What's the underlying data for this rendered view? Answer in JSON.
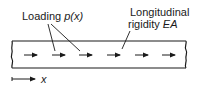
{
  "diagram": {
    "labels": {
      "loading_text": "Loading",
      "loading_func": "p(x)",
      "rigidity_line1": "Longitudinal",
      "rigidity_word": "rigidity",
      "rigidity_symbol": "EA",
      "axis_label": "x"
    },
    "elements": {
      "bar": {
        "type": "rectangular-bar",
        "ends": "broken-wavy"
      },
      "load_arrows": {
        "count": 6,
        "direction": "right"
      },
      "leaders": [
        "loading-to-arrow-2",
        "loading-to-arrow-3",
        "rigidity-to-arrow-4"
      ],
      "axis": {
        "direction": "right"
      }
    },
    "colors": {
      "ink": "#1a1a1a",
      "background": "#ffffff"
    }
  }
}
